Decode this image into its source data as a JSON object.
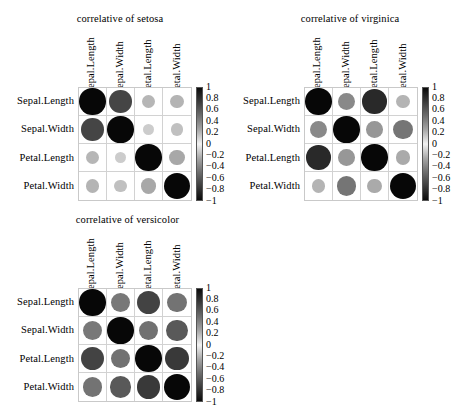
{
  "variables": [
    "Sepal.Length",
    "Sepal.Width",
    "Petal.Length",
    "Petal.Width"
  ],
  "legend": {
    "ticks": [
      "1",
      "0.8",
      "0.6",
      "0.4",
      "0.2",
      "0",
      "−0.2",
      "−0.4",
      "−0.6",
      "−0.8",
      "−1"
    ],
    "max": 1,
    "min": -1,
    "color_high": "#0a0a0a",
    "color_mid": "#f2f2f2",
    "color_low": "#0a0a0a"
  },
  "panels": [
    {
      "id": "setosa",
      "title": "correlative of setosa",
      "rows": [
        "Sepal.Length",
        "Sepal.Width",
        "Petal.Length",
        "Petal.Width"
      ],
      "cols": [
        "Sepal.Length",
        "Sepal.Width",
        "Petal.Length",
        "Petal.Width"
      ],
      "matrix": [
        [
          1.0,
          0.74,
          0.27,
          0.28
        ],
        [
          0.74,
          1.0,
          0.18,
          0.23
        ],
        [
          0.27,
          0.18,
          1.0,
          0.33
        ],
        [
          0.28,
          0.23,
          0.33,
          1.0
        ]
      ]
    },
    {
      "id": "virginica",
      "title": "correlative of virginica",
      "rows": [
        "Sepal.Length",
        "Sepal.Width",
        "Petal.Length",
        "Petal.Width"
      ],
      "cols": [
        "Sepal.Length",
        "Sepal.Width",
        "Petal.Length",
        "Petal.Width"
      ],
      "matrix": [
        [
          1.0,
          0.46,
          0.86,
          0.28
        ],
        [
          0.46,
          1.0,
          0.4,
          0.54
        ],
        [
          0.86,
          0.4,
          1.0,
          0.32
        ],
        [
          0.28,
          0.54,
          0.32,
          1.0
        ]
      ]
    },
    {
      "id": "versicolor",
      "title": "correlative of versicolor",
      "rows": [
        "Sepal.Length",
        "Sepal.Width",
        "Petal.Length",
        "Petal.Width"
      ],
      "cols": [
        "Sepal.Length",
        "Sepal.Width",
        "Petal.Length",
        "Petal.Width"
      ],
      "matrix": [
        [
          1.0,
          0.53,
          0.75,
          0.55
        ],
        [
          0.53,
          1.0,
          0.56,
          0.66
        ],
        [
          0.75,
          0.56,
          1.0,
          0.79
        ],
        [
          0.55,
          0.66,
          0.79,
          1.0
        ]
      ]
    }
  ],
  "chart_data": {
    "type": "heatmap",
    "subtitle": "",
    "xlabel": "",
    "ylabel": "",
    "grid": true,
    "legend_position": "right-of-each-panel",
    "encoding": "circle area and grayscale darkness proportional to |correlation|",
    "colorbar_range": [
      -1,
      1
    ],
    "colorbar_ticks": [
      1,
      0.8,
      0.6,
      0.4,
      0.2,
      0,
      -0.2,
      -0.4,
      -0.6,
      -0.8,
      -1
    ],
    "categories": [
      "Sepal.Length",
      "Sepal.Width",
      "Petal.Length",
      "Petal.Width"
    ],
    "panels": [
      {
        "name": "correlative of setosa",
        "x": [
          "Sepal.Length",
          "Sepal.Width",
          "Petal.Length",
          "Petal.Width"
        ],
        "y": [
          "Sepal.Length",
          "Sepal.Width",
          "Petal.Length",
          "Petal.Width"
        ],
        "values": [
          [
            1.0,
            0.74,
            0.27,
            0.28
          ],
          [
            0.74,
            1.0,
            0.18,
            0.23
          ],
          [
            0.27,
            0.18,
            1.0,
            0.33
          ],
          [
            0.28,
            0.23,
            0.33,
            1.0
          ]
        ]
      },
      {
        "name": "correlative of virginica",
        "x": [
          "Sepal.Length",
          "Sepal.Width",
          "Petal.Length",
          "Petal.Width"
        ],
        "y": [
          "Sepal.Length",
          "Sepal.Width",
          "Petal.Length",
          "Petal.Width"
        ],
        "values": [
          [
            1.0,
            0.46,
            0.86,
            0.28
          ],
          [
            0.46,
            1.0,
            0.4,
            0.54
          ],
          [
            0.86,
            0.4,
            1.0,
            0.32
          ],
          [
            0.28,
            0.54,
            0.32,
            1.0
          ]
        ]
      },
      {
        "name": "correlative of versicolor",
        "x": [
          "Sepal.Length",
          "Sepal.Width",
          "Petal.Length",
          "Petal.Width"
        ],
        "y": [
          "Sepal.Length",
          "Sepal.Width",
          "Petal.Length",
          "Petal.Width"
        ],
        "values": [
          [
            1.0,
            0.53,
            0.75,
            0.55
          ],
          [
            0.53,
            1.0,
            0.56,
            0.66
          ],
          [
            0.75,
            0.56,
            1.0,
            0.79
          ],
          [
            0.55,
            0.66,
            0.79,
            1.0
          ]
        ]
      }
    ]
  }
}
